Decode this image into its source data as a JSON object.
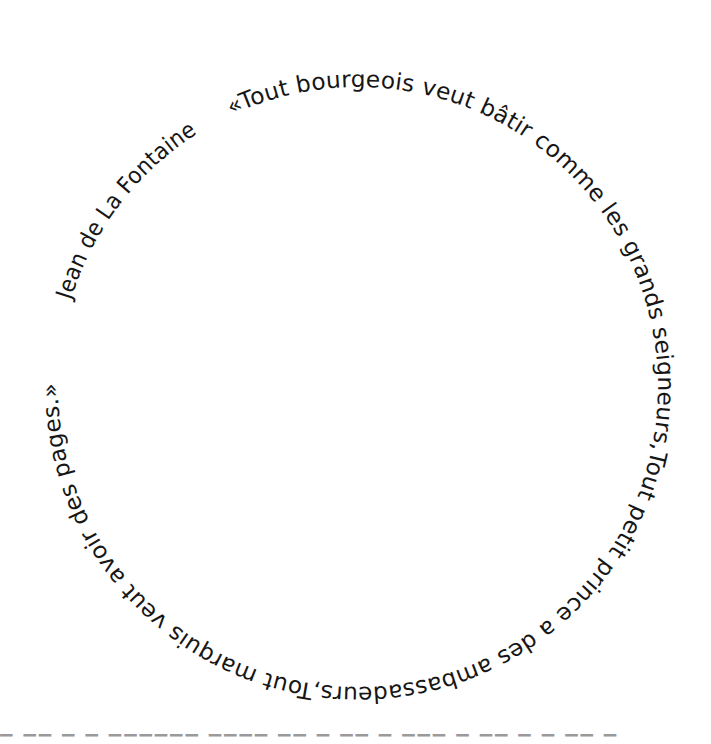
{
  "artwork": {
    "quote": "«Tout bourgeois veut bâtir comme les grands seigneurs,Tout petit prince a des ambassadeurs,Tout marquis veut avoir des pages.»",
    "author": "Jean de La Fontaine",
    "text_color": "#161616",
    "background": "#ffffff",
    "layout": {
      "shape": "circle",
      "center": [
        358,
        387
      ],
      "baseline_radius": 300,
      "direction": "clockwise"
    }
  },
  "cutoff_row": {
    "text": "▔ ▔▔ ▔ ▔ ▔▔▔▔▔▔ ▔▔▔▔ ▔▔ ▔ ▔▔ ▔ ▔▔▔ ▔ ▔▔ ▔ ▔ ▔▔ ▔"
  }
}
